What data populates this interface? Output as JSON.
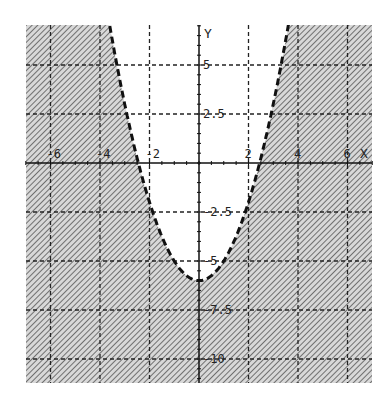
{
  "chart_data": {
    "type": "line",
    "title": "",
    "function": "y = x^2 - 6",
    "inequality": "y < x^2 - 6",
    "boundary_style": "dashed",
    "shading": "outside parabola (below/around curve), diagonal hatch",
    "xlabel": "X",
    "ylabel": "Y",
    "xlim": [
      -7.0,
      7.0
    ],
    "ylim": [
      -11.0,
      7.0
    ],
    "x_ticks": [
      -6,
      -4,
      -2,
      2,
      4,
      6
    ],
    "x_tick_labels": [
      "-6",
      "-4",
      "-2",
      "2",
      "4",
      "6"
    ],
    "y_ticks": [
      5,
      2.5,
      -2.5,
      -5,
      -7.5,
      -10
    ],
    "y_tick_labels": [
      "5",
      "2.5",
      "-2.5",
      "-5",
      "-7.5",
      "-10"
    ],
    "grid": true,
    "grid_style": "dashed",
    "vertex": [
      0,
      -6
    ],
    "series": [
      {
        "name": "boundary",
        "x": [
          -3.5,
          -3,
          -2.45,
          -2,
          -1,
          0,
          1,
          2,
          2.45,
          3,
          3.5
        ],
        "y": [
          6.25,
          3,
          0,
          -2,
          -5,
          -6,
          -5,
          -2,
          0,
          3,
          6.25
        ]
      }
    ]
  },
  "axes": {
    "x_label": "X",
    "y_label": "Y"
  },
  "colors": {
    "hatch": "#555555",
    "grid": "#222222",
    "curve": "#111111",
    "background": "#ffffff"
  }
}
